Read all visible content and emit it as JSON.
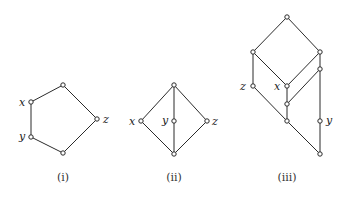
{
  "diagrams": [
    {
      "caption": "(i)",
      "caption_pos": [
        63,
        181
      ],
      "nodes": [
        {
          "id": "top",
          "x": 63,
          "y": 85,
          "label": ""
        },
        {
          "id": "x",
          "x": 31,
          "y": 102,
          "label": "x",
          "label_pos": [
            19,
            106
          ]
        },
        {
          "id": "y",
          "x": 31,
          "y": 137,
          "label": "y",
          "label_pos": [
            19,
            140
          ]
        },
        {
          "id": "bottom",
          "x": 63,
          "y": 153,
          "label": ""
        },
        {
          "id": "z",
          "x": 97,
          "y": 119,
          "label": "z",
          "label_pos": [
            103,
            123
          ]
        }
      ],
      "edges": [
        [
          "top",
          "x"
        ],
        [
          "x",
          "y"
        ],
        [
          "y",
          "bottom"
        ],
        [
          "bottom",
          "z"
        ],
        [
          "z",
          "top"
        ]
      ]
    },
    {
      "caption": "(ii)",
      "caption_pos": [
        174,
        181
      ],
      "nodes": [
        {
          "id": "top",
          "x": 174,
          "y": 85,
          "label": ""
        },
        {
          "id": "x",
          "x": 141,
          "y": 121,
          "label": "x",
          "label_pos": [
            129,
            125
          ]
        },
        {
          "id": "y",
          "x": 174,
          "y": 121,
          "label": "y",
          "label_pos": [
            162,
            124
          ]
        },
        {
          "id": "z",
          "x": 207,
          "y": 121,
          "label": "z",
          "label_pos": [
            212,
            125
          ]
        },
        {
          "id": "bottom",
          "x": 174,
          "y": 154,
          "label": ""
        }
      ],
      "edges": [
        [
          "top",
          "x"
        ],
        [
          "top",
          "y"
        ],
        [
          "top",
          "z"
        ],
        [
          "x",
          "bottom"
        ],
        [
          "y",
          "bottom"
        ],
        [
          "z",
          "bottom"
        ]
      ]
    },
    {
      "caption": "(iii)",
      "caption_pos": [
        287,
        181
      ],
      "nodes": [
        {
          "id": "top",
          "x": 287,
          "y": 17,
          "label": ""
        },
        {
          "id": "left",
          "x": 253,
          "y": 52,
          "label": ""
        },
        {
          "id": "right",
          "x": 320,
          "y": 52,
          "label": ""
        },
        {
          "id": "right2",
          "x": 320,
          "y": 69,
          "label": ""
        },
        {
          "id": "z",
          "x": 253,
          "y": 86,
          "label": "z",
          "label_pos": [
            240,
            90
          ]
        },
        {
          "id": "x",
          "x": 287,
          "y": 86,
          "label": "x",
          "label_pos": [
            274,
            90
          ]
        },
        {
          "id": "mid",
          "x": 287,
          "y": 104,
          "label": ""
        },
        {
          "id": "lower",
          "x": 287,
          "y": 121,
          "label": ""
        },
        {
          "id": "y",
          "x": 320,
          "y": 121,
          "label": "y",
          "label_pos": [
            326,
            124
          ]
        },
        {
          "id": "bottom",
          "x": 320,
          "y": 154,
          "label": ""
        }
      ],
      "edges": [
        [
          "top",
          "left"
        ],
        [
          "top",
          "right"
        ],
        [
          "left",
          "x"
        ],
        [
          "right",
          "x"
        ],
        [
          "left",
          "z"
        ],
        [
          "right",
          "right2"
        ],
        [
          "right2",
          "mid"
        ],
        [
          "x",
          "mid"
        ],
        [
          "mid",
          "lower"
        ],
        [
          "z",
          "lower"
        ],
        [
          "lower",
          "bottom"
        ],
        [
          "right2",
          "y"
        ],
        [
          "y",
          "bottom"
        ]
      ]
    }
  ]
}
